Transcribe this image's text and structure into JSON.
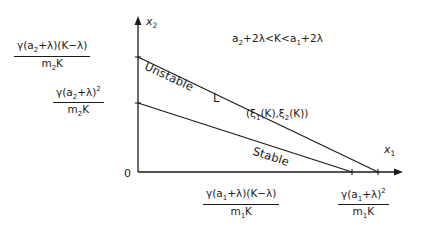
{
  "figure": {
    "axes": {
      "y_label": "x",
      "y_label_sub": "2",
      "x_label": "x",
      "x_label_sub": "1",
      "origin_label": "0"
    },
    "condition": {
      "lead": "a",
      "lead_sub": "2",
      "mid": "+2λ<K<a",
      "mid_sub": "1",
      "tail": "+2λ"
    },
    "curve_labels": {
      "unstable": "Unstable",
      "stable": "Stable",
      "line_L": "L"
    },
    "point_label": {
      "open": "(ξ",
      "sub1": "1",
      "mid": "(K),ξ",
      "sub2": "2",
      "close": "(K))"
    },
    "y_intercept_upper": {
      "num_a": "γ(a",
      "num_sub": "2",
      "num_b": "+λ)(K−λ)",
      "den_a": "m",
      "den_sub": "2",
      "den_b": "K"
    },
    "y_intercept_lower": {
      "num_a": "γ(a",
      "num_sub": "2",
      "num_b": "+λ)",
      "num_sup": "2",
      "den_a": "m",
      "den_sub": "2",
      "den_b": "K"
    },
    "x_intercept_inner": {
      "num_a": "γ(a",
      "num_sub": "1",
      "num_b": "+λ)(K−λ)",
      "den_a": "m",
      "den_sub": "1",
      "den_b": "K"
    },
    "x_intercept_outer": {
      "num_a": "γ(a",
      "num_sub": "1",
      "num_b": "+λ)",
      "num_sup": "2",
      "den_a": "m",
      "den_sub": "1",
      "den_b": "K"
    },
    "colors": {
      "ink": "#1a1a1a"
    }
  }
}
